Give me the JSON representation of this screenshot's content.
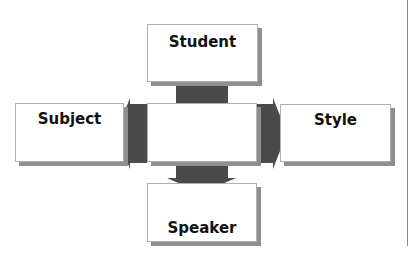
{
  "diagram": {
    "center": {
      "label": ""
    },
    "nodes": [
      {
        "id": "student",
        "label": "Student",
        "position": "top"
      },
      {
        "id": "subject",
        "label": "Subject",
        "position": "left"
      },
      {
        "id": "style",
        "label": "Style",
        "position": "right"
      },
      {
        "id": "speaker",
        "label": "Speaker",
        "position": "bottom"
      }
    ],
    "edges": [
      {
        "from": "center",
        "to": "student",
        "direction": "up"
      },
      {
        "from": "center",
        "to": "subject",
        "direction": "left"
      },
      {
        "from": "center",
        "to": "style",
        "direction": "right"
      },
      {
        "from": "center",
        "to": "speaker",
        "direction": "down"
      }
    ],
    "colors": {
      "arrow": "#4a4a4a",
      "shadow": "#8e8e8e",
      "box": "#ffffff"
    }
  }
}
